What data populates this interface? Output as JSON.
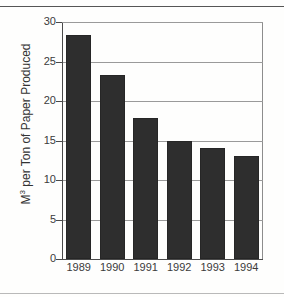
{
  "figure": {
    "background_color": "#fefefd",
    "rule_color": "#565656"
  },
  "chart_data": {
    "type": "bar",
    "title": "",
    "subtitle": "",
    "xlabel": "",
    "ylabel_parts": {
      "prefix": "M",
      "superscript": "3",
      "suffix": " per Ton of Paper Produced"
    },
    "ylabel": "M3 per Ton of Paper Produced",
    "categories": [
      "1989",
      "1990",
      "1991",
      "1992",
      "1993",
      "1994"
    ],
    "values": [
      28.3,
      23.3,
      17.9,
      15.0,
      14.0,
      13.0
    ],
    "ylim": [
      0,
      30
    ],
    "yticks": [
      0,
      5,
      10,
      15,
      20,
      25,
      30
    ],
    "ytick_labels": [
      "0",
      "5",
      "10",
      "15",
      "20",
      "25",
      "30"
    ],
    "grid": true,
    "grid_axis": "y",
    "legend": false,
    "legend_position": "none",
    "bar_color": "#2e2e2e",
    "grid_color": "#9a9a9a",
    "axis_color": "#4a4a4a"
  }
}
